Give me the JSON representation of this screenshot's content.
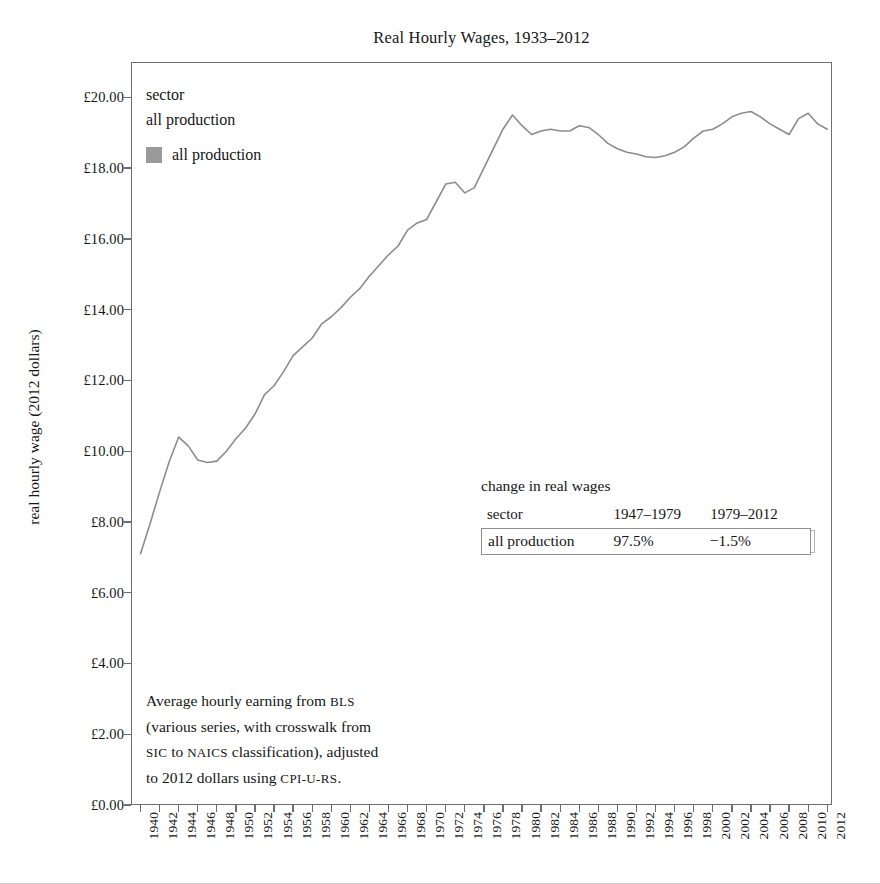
{
  "chart_data": {
    "type": "line",
    "title": "Real Hourly Wages, 1933–2012",
    "xlabel": "",
    "ylabel": "real hourly wage (2012 dollars)",
    "xlim": [
      1939,
      2012.5
    ],
    "ylim": [
      0,
      21
    ],
    "grid": false,
    "legend_position": "top-left-inside",
    "y_tick_labels": [
      "£0.00",
      "£2.00",
      "£4.00",
      "£6.00",
      "£8.00",
      "£10.00",
      "£12.00",
      "£14.00",
      "£16.00",
      "£18.00",
      "£20.00"
    ],
    "y_tick_values": [
      0,
      2,
      4,
      6,
      8,
      10,
      12,
      14,
      16,
      18,
      20
    ],
    "x_tick_labels": [
      "1940",
      "1942",
      "1944",
      "1946",
      "1948",
      "1950",
      "1952",
      "1954",
      "1956",
      "1958",
      "1960",
      "1962",
      "1964",
      "1966",
      "1968",
      "1970",
      "1972",
      "1974",
      "1976",
      "1978",
      "1980",
      "1982",
      "1984",
      "1986",
      "1988",
      "1990",
      "1992",
      "1994",
      "1996",
      "1998",
      "2000",
      "2002",
      "2004",
      "2006",
      "2008",
      "2010",
      "2012"
    ],
    "x_tick_values": [
      1940,
      1942,
      1944,
      1946,
      1948,
      1950,
      1952,
      1954,
      1956,
      1958,
      1960,
      1962,
      1964,
      1966,
      1968,
      1970,
      1972,
      1974,
      1976,
      1978,
      1980,
      1982,
      1984,
      1986,
      1988,
      1990,
      1992,
      1994,
      1996,
      1998,
      2000,
      2002,
      2004,
      2006,
      2008,
      2010,
      2012
    ],
    "series": [
      {
        "name": "all production",
        "color": "#8c8c8c",
        "x": [
          1940,
          1941,
          1942,
          1943,
          1944,
          1945,
          1946,
          1947,
          1948,
          1949,
          1950,
          1951,
          1952,
          1953,
          1954,
          1955,
          1956,
          1957,
          1958,
          1959,
          1960,
          1961,
          1962,
          1963,
          1964,
          1965,
          1966,
          1967,
          1968,
          1969,
          1970,
          1971,
          1972,
          1973,
          1974,
          1975,
          1976,
          1977,
          1978,
          1979,
          1980,
          1981,
          1982,
          1983,
          1984,
          1985,
          1986,
          1987,
          1988,
          1989,
          1990,
          1991,
          1992,
          1993,
          1994,
          1995,
          1996,
          1997,
          1998,
          1999,
          2000,
          2001,
          2002,
          2003,
          2004,
          2005,
          2006,
          2007,
          2008,
          2009,
          2010,
          2011,
          2012
        ],
        "y": [
          7.1,
          7.95,
          8.85,
          9.7,
          10.4,
          10.15,
          9.75,
          9.68,
          9.72,
          10.0,
          10.35,
          10.65,
          11.05,
          11.6,
          11.85,
          12.25,
          12.7,
          12.95,
          13.2,
          13.6,
          13.8,
          14.05,
          14.35,
          14.6,
          14.95,
          15.25,
          15.55,
          15.8,
          16.25,
          16.45,
          16.55,
          17.05,
          17.55,
          17.6,
          17.3,
          17.45,
          18.0,
          18.55,
          19.1,
          19.5,
          19.2,
          18.95,
          19.05,
          19.1,
          19.05,
          19.05,
          19.2,
          19.15,
          18.95,
          18.7,
          18.55,
          18.45,
          18.4,
          18.32,
          18.3,
          18.35,
          18.45,
          18.6,
          18.85,
          19.05,
          19.1,
          19.25,
          19.45,
          19.55,
          19.6,
          19.45,
          19.25,
          19.1,
          18.95,
          19.4,
          19.55,
          19.25,
          19.1
        ]
      }
    ],
    "annotations": {
      "change_table": {
        "title": "change in real wages",
        "columns": [
          "sector",
          "1947–1979",
          "1979–2012"
        ],
        "rows": [
          {
            "sector": "all production",
            "p1": "97.5%",
            "p2": "−1.5%"
          }
        ]
      },
      "source_note_lines": [
        "Average hourly earning from BLS",
        "(various series, with crosswalk from",
        "SIC to NAICS classification), adjusted",
        "to 2012 dollars using CPI-U-RS."
      ]
    }
  },
  "title": "Real Hourly Wages, 1933–2012",
  "y_axis": {
    "title": "real hourly wage (2012 dollars)"
  },
  "legend": {
    "header_label": "sector",
    "header_value": "all production",
    "entry_label": "all production",
    "swatch_color": "#9a9a9a"
  },
  "change_table": {
    "title": "change in real wages",
    "col_sector": "sector",
    "col_period1": "1947–1979",
    "col_period2": "1979–2012",
    "row_sector": "all production",
    "row_p1": "97.5%",
    "row_p2": "−1.5%"
  },
  "source_note": {
    "line1_a": "Average hourly earning from ",
    "line1_b": "BLS",
    "line2": "(various series, with crosswalk from",
    "line3_a": "SIC",
    "line3_b": " to ",
    "line3_c": "NAICS",
    "line3_d": " classification), adjusted",
    "line4_a": "to 2012 dollars using ",
    "line4_b": "CPI-U-RS",
    "line4_c": "."
  }
}
